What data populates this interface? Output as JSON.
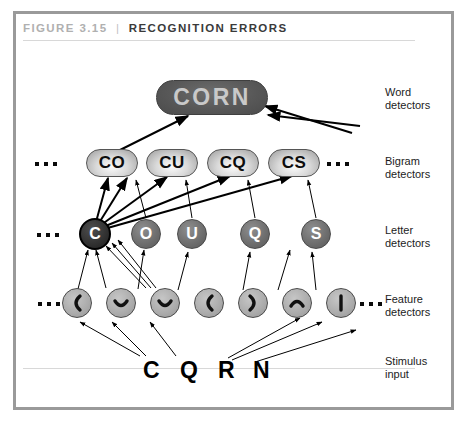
{
  "figure": {
    "number_label": "FIGURE 3.15",
    "separator": "|",
    "title": "RECOGNITION ERRORS"
  },
  "side_labels": [
    {
      "line1": "Word",
      "line2": "detectors"
    },
    {
      "line1": "Bigram",
      "line2": "detectors"
    },
    {
      "line1": "Letter",
      "line2": "detectors"
    },
    {
      "line1": "Feature",
      "line2": "detectors"
    },
    {
      "line1": "Stimulus",
      "line2": "input"
    }
  ],
  "layers": {
    "word": {
      "nodes": [
        {
          "label": "CORN",
          "state": "active"
        }
      ]
    },
    "bigram": {
      "left_ellipsis": "...",
      "right_ellipsis": "...",
      "nodes": [
        {
          "label": "CO"
        },
        {
          "label": "CU"
        },
        {
          "label": "CQ"
        },
        {
          "label": "CS"
        }
      ]
    },
    "letter": {
      "left_ellipsis": "...",
      "nodes": [
        {
          "label": "C",
          "state": "active"
        },
        {
          "label": "O",
          "state": "normal"
        },
        {
          "label": "U",
          "state": "normal"
        },
        {
          "label": "Q",
          "state": "normal"
        },
        {
          "label": "S",
          "state": "normal"
        }
      ]
    },
    "feature": {
      "left_ellipsis": "...",
      "right_ellipsis": "...",
      "nodes": [
        {
          "glyph": "left-paren-curve"
        },
        {
          "glyph": "bottom-curve"
        },
        {
          "glyph": "bottom-curve"
        },
        {
          "glyph": "left-paren-curve"
        },
        {
          "glyph": "right-paren-curve"
        },
        {
          "glyph": "top-curve"
        },
        {
          "glyph": "vertical-bar"
        }
      ]
    },
    "stimulus": {
      "letters": [
        "C",
        "Q",
        "R",
        "N"
      ]
    }
  },
  "colors": {
    "frame": "#9a9a9a",
    "word_node": "#585858",
    "letter_node": "#6f6f6f",
    "letter_node_active": "#1d1d1d",
    "feature_node": "#ababab",
    "arrow": "#000000",
    "title_accent": "#b0b0b0"
  }
}
